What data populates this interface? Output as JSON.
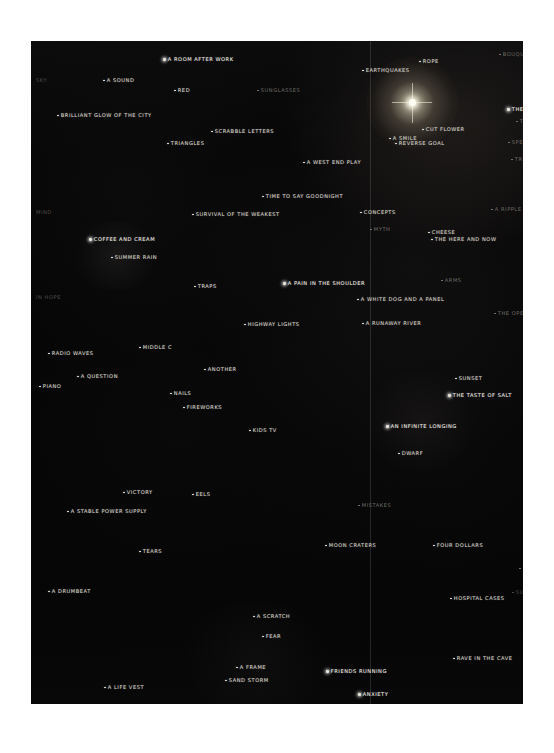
{
  "artwork": {
    "title": "Dark photographic word map",
    "canvas_color": "#050506",
    "page_background": "#ffffff",
    "seam_label": "vertical panel seam",
    "light_source_label": "bright light source"
  },
  "labels": [
    {
      "text": "A ROOM AFTER WORK",
      "x": 163,
      "y": 56,
      "style": "bright",
      "dot": true
    },
    {
      "text": "SKY",
      "x": 36,
      "y": 77,
      "style": "faint",
      "dot": false
    },
    {
      "text": "A SOUND",
      "x": 103,
      "y": 77,
      "style": "normal",
      "dot": true
    },
    {
      "text": "RED",
      "x": 174,
      "y": 87,
      "style": "normal",
      "dot": true
    },
    {
      "text": "SUNGLASSES",
      "x": 257,
      "y": 87,
      "style": "dim",
      "dot": true
    },
    {
      "text": "EARTHQUAKES",
      "x": 362,
      "y": 67,
      "style": "normal",
      "dot": true
    },
    {
      "text": "ROPE",
      "x": 419,
      "y": 58,
      "style": "normal",
      "dot": true
    },
    {
      "text": "BOUQUET",
      "x": 499,
      "y": 51,
      "style": "dim",
      "dot": true
    },
    {
      "text": "BRILLIANT GLOW OF THE CITY",
      "x": 57,
      "y": 112,
      "style": "normal",
      "dot": true
    },
    {
      "text": "SCRABBLE LETTERS",
      "x": 211,
      "y": 128,
      "style": "normal",
      "dot": true
    },
    {
      "text": "TRIANGLES",
      "x": 167,
      "y": 140,
      "style": "normal",
      "dot": true
    },
    {
      "text": "THE SUN",
      "x": 507,
      "y": 106,
      "style": "bright",
      "dot": true
    },
    {
      "text": "T",
      "x": 516,
      "y": 118,
      "style": "dim",
      "dot": true
    },
    {
      "text": "CUT FLOWER",
      "x": 422,
      "y": 126,
      "style": "normal",
      "dot": true
    },
    {
      "text": "A SMILE",
      "x": 389,
      "y": 135,
      "style": "normal",
      "dot": true
    },
    {
      "text": "REVERSE GOAL",
      "x": 395,
      "y": 140,
      "style": "normal",
      "dot": true
    },
    {
      "text": "SPECIAL",
      "x": 508,
      "y": 139,
      "style": "dim",
      "dot": true
    },
    {
      "text": "A WEST END PLAY",
      "x": 303,
      "y": 159,
      "style": "normal",
      "dot": true
    },
    {
      "text": "TRIP",
      "x": 511,
      "y": 156,
      "style": "dim",
      "dot": true
    },
    {
      "text": "TIME TO SAY GOODNIGHT",
      "x": 262,
      "y": 193,
      "style": "normal",
      "dot": true
    },
    {
      "text": "A RIPPLE IN TH",
      "x": 491,
      "y": 206,
      "style": "dim",
      "dot": true
    },
    {
      "text": "MIND",
      "x": 36,
      "y": 209,
      "style": "faint",
      "dot": false
    },
    {
      "text": "SURVIVAL OF THE WEAKEST",
      "x": 192,
      "y": 211,
      "style": "normal",
      "dot": true
    },
    {
      "text": "CONCEPTS",
      "x": 360,
      "y": 209,
      "style": "normal",
      "dot": true
    },
    {
      "text": "MYTH",
      "x": 370,
      "y": 226,
      "style": "dim",
      "dot": true
    },
    {
      "text": "COFFEE AND CREAM",
      "x": 89,
      "y": 236,
      "style": "bright",
      "dot": true
    },
    {
      "text": "CHEESE",
      "x": 428,
      "y": 229,
      "style": "normal",
      "dot": true
    },
    {
      "text": "THE HERE AND NOW",
      "x": 431,
      "y": 236,
      "style": "normal",
      "dot": true
    },
    {
      "text": "SUMMER RAIN",
      "x": 111,
      "y": 254,
      "style": "normal",
      "dot": true
    },
    {
      "text": "ARMS",
      "x": 441,
      "y": 277,
      "style": "dim",
      "dot": true
    },
    {
      "text": "TRAPS",
      "x": 194,
      "y": 283,
      "style": "normal",
      "dot": true
    },
    {
      "text": "A PAIN IN THE SHOULDER",
      "x": 283,
      "y": 280,
      "style": "bright",
      "dot": true
    },
    {
      "text": "IN HOPE",
      "x": 36,
      "y": 294,
      "style": "faint",
      "dot": false
    },
    {
      "text": "A WHITE DOG AND A PANEL",
      "x": 357,
      "y": 296,
      "style": "normal",
      "dot": true
    },
    {
      "text": "THE OPEN SKY",
      "x": 494,
      "y": 310,
      "style": "dim",
      "dot": true
    },
    {
      "text": "A RUNAWAY RIVER",
      "x": 362,
      "y": 320,
      "style": "normal",
      "dot": true
    },
    {
      "text": "HIGHWAY LIGHTS",
      "x": 244,
      "y": 321,
      "style": "normal",
      "dot": true
    },
    {
      "text": "MIDDLE C",
      "x": 139,
      "y": 344,
      "style": "normal",
      "dot": true
    },
    {
      "text": "RADIO WAVES",
      "x": 48,
      "y": 350,
      "style": "normal",
      "dot": true
    },
    {
      "text": "H",
      "x": 527,
      "y": 352,
      "style": "faint",
      "dot": false
    },
    {
      "text": "ANOTHER",
      "x": 204,
      "y": 366,
      "style": "normal",
      "dot": true
    },
    {
      "text": "A QUESTION",
      "x": 77,
      "y": 373,
      "style": "normal",
      "dot": true
    },
    {
      "text": "SUNSET",
      "x": 455,
      "y": 375,
      "style": "normal",
      "dot": true
    },
    {
      "text": "PIANO",
      "x": 39,
      "y": 383,
      "style": "normal",
      "dot": true
    },
    {
      "text": "NAILS",
      "x": 170,
      "y": 390,
      "style": "normal",
      "dot": true
    },
    {
      "text": "THE TASTE OF SALT",
      "x": 448,
      "y": 392,
      "style": "bright",
      "dot": true
    },
    {
      "text": "FIREWORKS",
      "x": 183,
      "y": 404,
      "style": "normal",
      "dot": true
    },
    {
      "text": "KIDS TV",
      "x": 249,
      "y": 427,
      "style": "normal",
      "dot": true
    },
    {
      "text": "AN INFINITE LONGING",
      "x": 386,
      "y": 423,
      "style": "bright",
      "dot": true
    },
    {
      "text": "DWARF",
      "x": 398,
      "y": 450,
      "style": "normal",
      "dot": true
    },
    {
      "text": "VICTORY",
      "x": 123,
      "y": 489,
      "style": "normal",
      "dot": true
    },
    {
      "text": "EELS",
      "x": 192,
      "y": 491,
      "style": "normal",
      "dot": true
    },
    {
      "text": "MISTAKES",
      "x": 358,
      "y": 502,
      "style": "dim",
      "dot": true
    },
    {
      "text": "A STABLE POWER SUPPLY",
      "x": 67,
      "y": 508,
      "style": "normal",
      "dot": true
    },
    {
      "text": "MOON CRATERS",
      "x": 325,
      "y": 542,
      "style": "normal",
      "dot": true
    },
    {
      "text": "FOUR DOLLARS",
      "x": 433,
      "y": 542,
      "style": "normal",
      "dot": true
    },
    {
      "text": "TEARS",
      "x": 139,
      "y": 548,
      "style": "normal",
      "dot": true
    },
    {
      "text": "J",
      "x": 526,
      "y": 555,
      "style": "faint",
      "dot": false
    },
    {
      "text": "THE",
      "x": 519,
      "y": 565,
      "style": "dim",
      "dot": true
    },
    {
      "text": "A DRUMBEAT",
      "x": 48,
      "y": 588,
      "style": "normal",
      "dot": true
    },
    {
      "text": "HOSPITAL CASES",
      "x": 450,
      "y": 595,
      "style": "normal",
      "dot": true
    },
    {
      "text": "SUNFLOW",
      "x": 512,
      "y": 589,
      "style": "faint",
      "dot": true
    },
    {
      "text": "A SCRATCH",
      "x": 253,
      "y": 613,
      "style": "normal",
      "dot": true
    },
    {
      "text": "FEAR",
      "x": 262,
      "y": 633,
      "style": "normal",
      "dot": true
    },
    {
      "text": "RAVE IN THE CAVE",
      "x": 453,
      "y": 655,
      "style": "normal",
      "dot": true
    },
    {
      "text": "A FRAME",
      "x": 236,
      "y": 664,
      "style": "normal",
      "dot": true
    },
    {
      "text": "FRIENDS RUNNING",
      "x": 326,
      "y": 668,
      "style": "bright",
      "dot": true
    },
    {
      "text": "SAND STORM",
      "x": 225,
      "y": 677,
      "style": "normal",
      "dot": true
    },
    {
      "text": "A LIFE VEST",
      "x": 104,
      "y": 684,
      "style": "normal",
      "dot": true
    },
    {
      "text": "ANXIETY",
      "x": 358,
      "y": 691,
      "style": "bright",
      "dot": true
    },
    {
      "text": "MILD WORLD",
      "x": 169,
      "y": 706,
      "style": "normal",
      "dot": true
    }
  ]
}
